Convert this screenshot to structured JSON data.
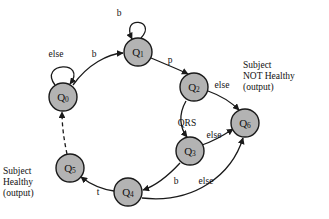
{
  "diagram": {
    "colors": {
      "node_fill": "#b3b3b3",
      "node_stroke": "#1a1a1a",
      "edge": "#1a1a1a",
      "background": "#ffffff",
      "text": "#111111"
    },
    "nodes": [
      {
        "id": "Q0",
        "name": "Q",
        "sub": "0",
        "cx": 63,
        "cy": 97,
        "r": 14
      },
      {
        "id": "Q1",
        "name": "Q",
        "sub": "1",
        "cx": 138,
        "cy": 52,
        "r": 14
      },
      {
        "id": "Q2",
        "name": "Q",
        "sub": "2",
        "cx": 194,
        "cy": 87,
        "r": 14
      },
      {
        "id": "Q3",
        "name": "Q",
        "sub": "3",
        "cx": 190,
        "cy": 151,
        "r": 14
      },
      {
        "id": "Q4",
        "name": "Q",
        "sub": "4",
        "cx": 128,
        "cy": 192,
        "r": 14
      },
      {
        "id": "Q5",
        "name": "Q",
        "sub": "5",
        "cx": 70,
        "cy": 168,
        "r": 14
      },
      {
        "id": "Q6",
        "name": "Q",
        "sub": "6",
        "cx": 245,
        "cy": 123,
        "r": 14
      }
    ],
    "transitions": [
      {
        "id": "t-q0-self",
        "from": "Q0",
        "to": "Q0",
        "label": "else",
        "label_x": 56,
        "label_y": 55,
        "kind": "self-loop"
      },
      {
        "id": "t-q0-q1",
        "from": "Q0",
        "to": "Q1",
        "label": "b",
        "label_x": 94,
        "label_y": 55,
        "kind": "curve"
      },
      {
        "id": "t-q1-self",
        "from": "Q1",
        "to": "Q1",
        "label": "b",
        "label_x": 119,
        "label_y": 14,
        "kind": "self-loop"
      },
      {
        "id": "t-q1-q2",
        "from": "Q1",
        "to": "Q2",
        "label": "p",
        "label_x": 170,
        "label_y": 61,
        "kind": "curve"
      },
      {
        "id": "t-q2-q6",
        "from": "Q2",
        "to": "Q6",
        "label": "else",
        "label_x": 222,
        "label_y": 88,
        "kind": "curve"
      },
      {
        "id": "t-q2-q3",
        "from": "Q2",
        "to": "Q3",
        "label": "QRS",
        "label_x": 187,
        "label_y": 124,
        "kind": "curve"
      },
      {
        "id": "t-q3-q6",
        "from": "Q3",
        "to": "Q6",
        "label": "else",
        "label_x": 214,
        "label_y": 136,
        "kind": "curve"
      },
      {
        "id": "t-q3-q4",
        "from": "Q3",
        "to": "Q4",
        "label": "b",
        "label_x": 176,
        "label_y": 182,
        "kind": "curve"
      },
      {
        "id": "t-q4-q6",
        "from": "Q4",
        "to": "Q6",
        "label": "else",
        "label_x": 206,
        "label_y": 182,
        "kind": "curve"
      },
      {
        "id": "t-q4-q5",
        "from": "Q4",
        "to": "Q5",
        "label": "t",
        "label_x": 98,
        "label_y": 193,
        "kind": "curve"
      },
      {
        "id": "t-q5-q0",
        "from": "Q5",
        "to": "Q0",
        "label": "",
        "label_x": 0,
        "label_y": 0,
        "kind": "dashed"
      }
    ],
    "outputs": [
      {
        "id": "output-not-healthy",
        "lines": "Subject\nNOT Healthy\n(output)"
      },
      {
        "id": "output-healthy",
        "lines": "Subject\nHealthy\n(output)"
      }
    ]
  }
}
